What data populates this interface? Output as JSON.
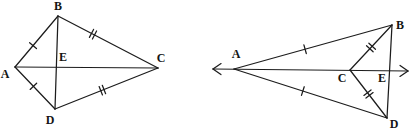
{
  "diagram": {
    "stroke_color": "#1c1c1c",
    "label_color": "#141414",
    "background_color": "#ffffff",
    "figures": [
      {
        "id": "left-kite",
        "points": {
          "A": [
            15,
            67
          ],
          "B": [
            58,
            16
          ],
          "C": [
            158,
            68
          ],
          "D": [
            55,
            109
          ],
          "E": [
            56.8,
            67.4
          ]
        },
        "labels": [
          {
            "text": "A",
            "x": 5,
            "y": 74
          },
          {
            "text": "B",
            "x": 58,
            "y": 6
          },
          {
            "text": "C",
            "x": 161,
            "y": 58
          },
          {
            "text": "D",
            "x": 50,
            "y": 120
          },
          {
            "text": "E",
            "x": 63,
            "y": 57
          }
        ],
        "segments": [
          {
            "from": "A",
            "to": "B",
            "ticks": 1,
            "t": 0.42
          },
          {
            "from": "B",
            "to": "C",
            "ticks": 2,
            "t": 0.35
          },
          {
            "from": "A",
            "to": "D",
            "ticks": 1,
            "t": 0.46
          },
          {
            "from": "D",
            "to": "C",
            "ticks": 2,
            "t": 0.46
          },
          {
            "from": "A",
            "to": "C",
            "ticks": 0
          },
          {
            "from": "B",
            "to": "D",
            "ticks": 0
          }
        ],
        "arrow_lines": []
      },
      {
        "id": "right-dart",
        "points": {
          "A": [
            234,
            69
          ],
          "B": [
            392,
            25
          ],
          "C": [
            350,
            70
          ],
          "D": [
            387,
            118
          ],
          "E": [
            389.5,
            71
          ]
        },
        "labels": [
          {
            "text": "A",
            "x": 236,
            "y": 54
          },
          {
            "text": "B",
            "x": 400,
            "y": 25
          },
          {
            "text": "C",
            "x": 342,
            "y": 78
          },
          {
            "text": "D",
            "x": 394,
            "y": 124
          },
          {
            "text": "E",
            "x": 382,
            "y": 78
          }
        ],
        "segments": [
          {
            "from": "A",
            "to": "B",
            "ticks": 1,
            "t": 0.45
          },
          {
            "from": "A",
            "to": "D",
            "ticks": 1,
            "t": 0.45
          },
          {
            "from": "C",
            "to": "B",
            "ticks": 2,
            "t": 0.5
          },
          {
            "from": "C",
            "to": "D",
            "ticks": 2,
            "t": 0.5
          },
          {
            "from": "B",
            "to": "D",
            "ticks": 0
          }
        ],
        "arrow_lines": [
          {
            "x1": 213,
            "y1": 69,
            "x2": 408,
            "y2": 71,
            "arrow_start": true,
            "arrow_end": true
          }
        ]
      }
    ],
    "tick_style": {
      "half_length": 4.5,
      "double_gap": 3.4
    },
    "arrow_style": {
      "length": 8,
      "half_width": 5.5
    }
  }
}
